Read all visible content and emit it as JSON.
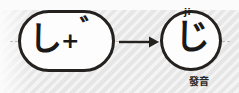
{
  "diagram": {
    "background_color": "#e6e6e6",
    "stroke_color": "#24211f"
  },
  "source_group": {
    "name": "shi-plus-dakuten",
    "base_kana": "し",
    "operator": "+",
    "modifier": "゛"
  },
  "arrow": {
    "name": "transforms-to",
    "direction": "right"
  },
  "result_group": {
    "name": "ji",
    "kana": "じ",
    "romaji": "ji"
  },
  "caption": {
    "label": "發音"
  }
}
